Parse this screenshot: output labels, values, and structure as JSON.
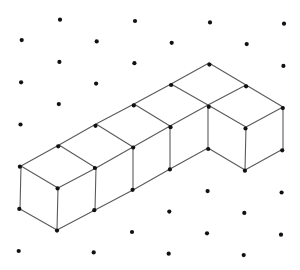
{
  "diagram": {
    "type": "isometric-dot-grid-cubes",
    "cube_count": 6,
    "colors": {
      "dot": "#111111",
      "edge": "#5a5a5a",
      "background": "#ffffff"
    },
    "grid": {
      "rows": 12,
      "row_spacing": 21.1,
      "col_spacing": 75,
      "even_row_x": [
        60,
        135,
        210,
        284
      ],
      "odd_row_x": [
        22,
        97,
        172,
        247
      ],
      "y0": 19,
      "x_drift_per_row": -0.3,
      "y_skew_per_px": 0.018
    },
    "vertices": {
      "A": [
        209,
        63
      ],
      "B": [
        171,
        84
      ],
      "C": [
        246,
        85
      ],
      "D": [
        208,
        105
      ],
      "E": [
        170,
        126
      ],
      "F": [
        246,
        127
      ],
      "G": [
        283,
        107
      ],
      "H": [
        134,
        104
      ],
      "I": [
        96,
        124
      ],
      "J": [
        133,
        147
      ],
      "K": [
        208,
        148
      ],
      "L": [
        96,
        168
      ],
      "M": [
        170,
        169
      ],
      "N": [
        133,
        190
      ],
      "O": [
        59,
        145
      ],
      "P": [
        21,
        166
      ],
      "Q": [
        58,
        188
      ],
      "R": [
        20,
        209
      ],
      "S": [
        57,
        230
      ],
      "T": [
        95,
        210
      ],
      "U": [
        245,
        170
      ],
      "V": [
        283,
        149
      ]
    },
    "edges": [
      [
        "A",
        "B"
      ],
      [
        "B",
        "H"
      ],
      [
        "H",
        "I"
      ],
      [
        "I",
        "O"
      ],
      [
        "O",
        "P"
      ],
      [
        "A",
        "C"
      ],
      [
        "C",
        "G"
      ],
      [
        "C",
        "D"
      ],
      [
        "D",
        "E"
      ],
      [
        "E",
        "J"
      ],
      [
        "J",
        "L"
      ],
      [
        "L",
        "Q"
      ],
      [
        "B",
        "D"
      ],
      [
        "H",
        "E"
      ],
      [
        "I",
        "J"
      ],
      [
        "O",
        "L"
      ],
      [
        "P",
        "Q"
      ],
      [
        "G",
        "F"
      ],
      [
        "F",
        "D"
      ],
      [
        "D",
        "K"
      ],
      [
        "F",
        "U"
      ],
      [
        "G",
        "V"
      ],
      [
        "E",
        "M"
      ],
      [
        "J",
        "N"
      ],
      [
        "L",
        "T"
      ],
      [
        "Q",
        "S"
      ],
      [
        "P",
        "R"
      ],
      [
        "R",
        "S"
      ],
      [
        "S",
        "T"
      ],
      [
        "T",
        "N"
      ],
      [
        "N",
        "M"
      ],
      [
        "M",
        "K"
      ],
      [
        "K",
        "U"
      ],
      [
        "U",
        "V"
      ]
    ]
  }
}
